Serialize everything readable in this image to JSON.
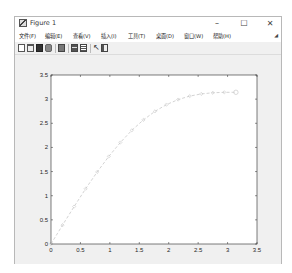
{
  "window": {
    "title": "Figure 1",
    "controls": {
      "minimize": "–",
      "maximize": "☐",
      "close": "✕"
    }
  },
  "menubar": {
    "items": [
      {
        "label": "文件(F)"
      },
      {
        "label": "编辑(E)"
      },
      {
        "label": "查看(V)"
      },
      {
        "label": "插入(I)"
      },
      {
        "label": "工具(T)"
      },
      {
        "label": "桌面(D)"
      },
      {
        "label": "窗口(W)"
      },
      {
        "label": "帮助(H)"
      }
    ],
    "dock_icon": "dock-arrow-icon"
  },
  "toolbar": {
    "buttons": [
      {
        "icon": "new-figure-icon"
      },
      {
        "icon": "open-file-icon"
      },
      {
        "icon": "save-icon"
      },
      {
        "icon": "print-icon"
      },
      {
        "icon": "link-plot-icon"
      },
      {
        "icon": "insert-colorbar-icon"
      },
      {
        "icon": "insert-legend-icon"
      },
      {
        "icon": "edit-plot-icon"
      },
      {
        "icon": "property-inspector-icon"
      }
    ]
  },
  "chart_data": {
    "type": "line",
    "title": "",
    "xlabel": "",
    "ylabel": "",
    "xlim": [
      0,
      3.5
    ],
    "ylim": [
      0,
      3.5
    ],
    "xticks": [
      "0",
      "0.5",
      "1",
      "1.5",
      "2",
      "2.5",
      "3",
      "3.5"
    ],
    "yticks": [
      "0",
      "0.5",
      "1",
      "1.5",
      "2",
      "2.5",
      "3",
      "3.5"
    ],
    "grid": false,
    "legend": null,
    "series": [
      {
        "name": "y",
        "line_style": "dashed",
        "marker": "diamond",
        "color": "#c8c8c8",
        "x": [
          0,
          0.196,
          0.393,
          0.589,
          0.785,
          0.982,
          1.178,
          1.374,
          1.571,
          1.767,
          1.963,
          2.16,
          2.356,
          2.553,
          2.749,
          2.945,
          3.142
        ],
        "y": [
          0,
          0.391,
          0.775,
          1.145,
          1.492,
          1.813,
          2.102,
          2.355,
          2.571,
          2.748,
          2.887,
          2.991,
          3.063,
          3.108,
          3.132,
          3.141,
          3.142
        ]
      }
    ]
  }
}
